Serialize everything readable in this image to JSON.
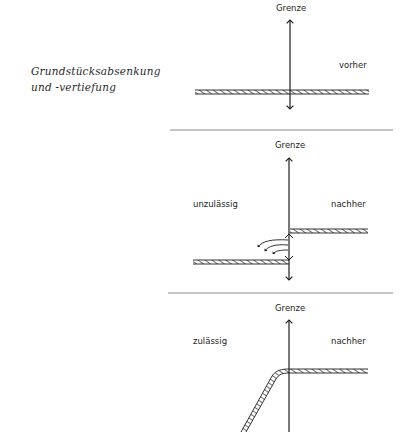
{
  "caption": {
    "line1": "Grundstücksabsenkung",
    "line2": "und -vertiefung"
  },
  "panels": [
    {
      "id": "before",
      "boundary_label": "Grenze",
      "state_label": "vorher",
      "verdict_label": ""
    },
    {
      "id": "not-allowed",
      "boundary_label": "Grenze",
      "state_label": "nachher",
      "verdict_label": "unzulässig"
    },
    {
      "id": "allowed",
      "boundary_label": "Grenze",
      "state_label": "nachher",
      "verdict_label": "zulässig"
    }
  ],
  "colors": {
    "ink": "#1e1e1e",
    "separator": "#8a8a8a",
    "background": "#ffffff"
  }
}
